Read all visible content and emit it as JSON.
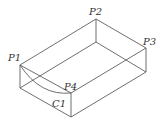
{
  "diagram": {
    "type": "isometric-box",
    "line_color": "#4a4a4a",
    "labels": {
      "p1": "P1",
      "p2": "P2",
      "p3": "P3",
      "p4": "P4",
      "c1": "C1"
    },
    "vertices": {
      "P1": [
        20,
        65
      ],
      "P2": [
        96,
        19
      ],
      "P3": [
        146,
        48
      ],
      "P4": [
        71,
        93
      ],
      "B1": [
        20,
        88
      ],
      "B2": [
        96,
        42
      ],
      "B3": [
        146,
        72
      ],
      "B4": [
        71,
        117
      ]
    },
    "curve": {
      "name": "C1",
      "from": "P1",
      "to": "P4"
    }
  }
}
